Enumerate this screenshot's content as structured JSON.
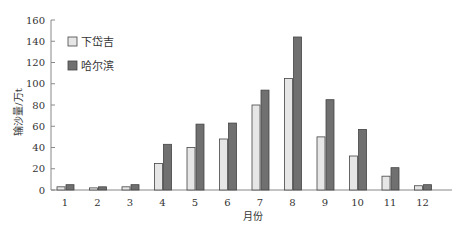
{
  "chart_data": {
    "type": "bar",
    "title": "",
    "xlabel": "月份",
    "ylabel": "输沙量/万t",
    "categories": [
      "1",
      "2",
      "3",
      "4",
      "5",
      "6",
      "7",
      "8",
      "9",
      "10",
      "11",
      "12"
    ],
    "series": [
      {
        "name": "下岱吉",
        "color": "#e6e6e6",
        "values": [
          3,
          2,
          3,
          25,
          40,
          48,
          80,
          105,
          50,
          32,
          13,
          4
        ]
      },
      {
        "name": "哈尔滨",
        "color": "#707070",
        "values": [
          5,
          3,
          5,
          43,
          62,
          63,
          94,
          144,
          85,
          57,
          21,
          5
        ]
      }
    ],
    "ylim": [
      0,
      160
    ],
    "yticks": [
      0,
      20,
      40,
      60,
      80,
      100,
      120,
      140,
      160
    ],
    "grid": false,
    "legend_position": "upper-left"
  }
}
